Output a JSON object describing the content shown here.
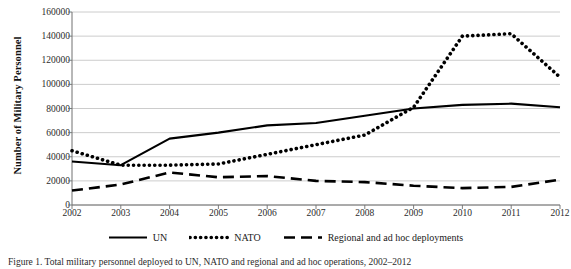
{
  "figure": {
    "caption": "Figure 1. Total military personnel deployed to UN, NATO and regional and ad hoc operations, 2002–2012"
  },
  "chart_data": {
    "type": "line",
    "title": "",
    "xlabel": "",
    "ylabel": "Number of Military Personnel",
    "categories": [
      "2002",
      "2003",
      "2004",
      "2005",
      "2006",
      "2007",
      "2008",
      "2009",
      "2010",
      "2011",
      "2012"
    ],
    "x": [
      2002,
      2003,
      2004,
      2005,
      2006,
      2007,
      2008,
      2009,
      2010,
      2011,
      2012
    ],
    "ylim": [
      0,
      160000
    ],
    "ytick_step": 20000,
    "yticks": [
      0,
      20000,
      40000,
      60000,
      80000,
      100000,
      120000,
      140000,
      160000
    ],
    "ytick_labels": [
      "0",
      "20000",
      "40000",
      "60000",
      "80000",
      "100000",
      "120000",
      "140000",
      "160000"
    ],
    "grid": "horizontal",
    "legend_position": "bottom",
    "series": [
      {
        "name": "UN",
        "style": "solid",
        "color": "#000000",
        "values": [
          36000,
          33000,
          55000,
          60000,
          66000,
          68000,
          74000,
          80000,
          83000,
          84000,
          81000
        ]
      },
      {
        "name": "NATO",
        "style": "dotted",
        "color": "#000000",
        "values": [
          45000,
          33000,
          33000,
          34000,
          42000,
          50000,
          58000,
          81000,
          140000,
          142000,
          106000
        ]
      },
      {
        "name": "Regional and ad hoc deployments",
        "style": "dashed",
        "color": "#000000",
        "values": [
          12000,
          17000,
          27000,
          23000,
          24000,
          20000,
          19000,
          16000,
          14000,
          15000,
          21000
        ]
      }
    ]
  },
  "axis": {
    "line_color": "#808080",
    "grid_color": "#bfbfbf"
  }
}
